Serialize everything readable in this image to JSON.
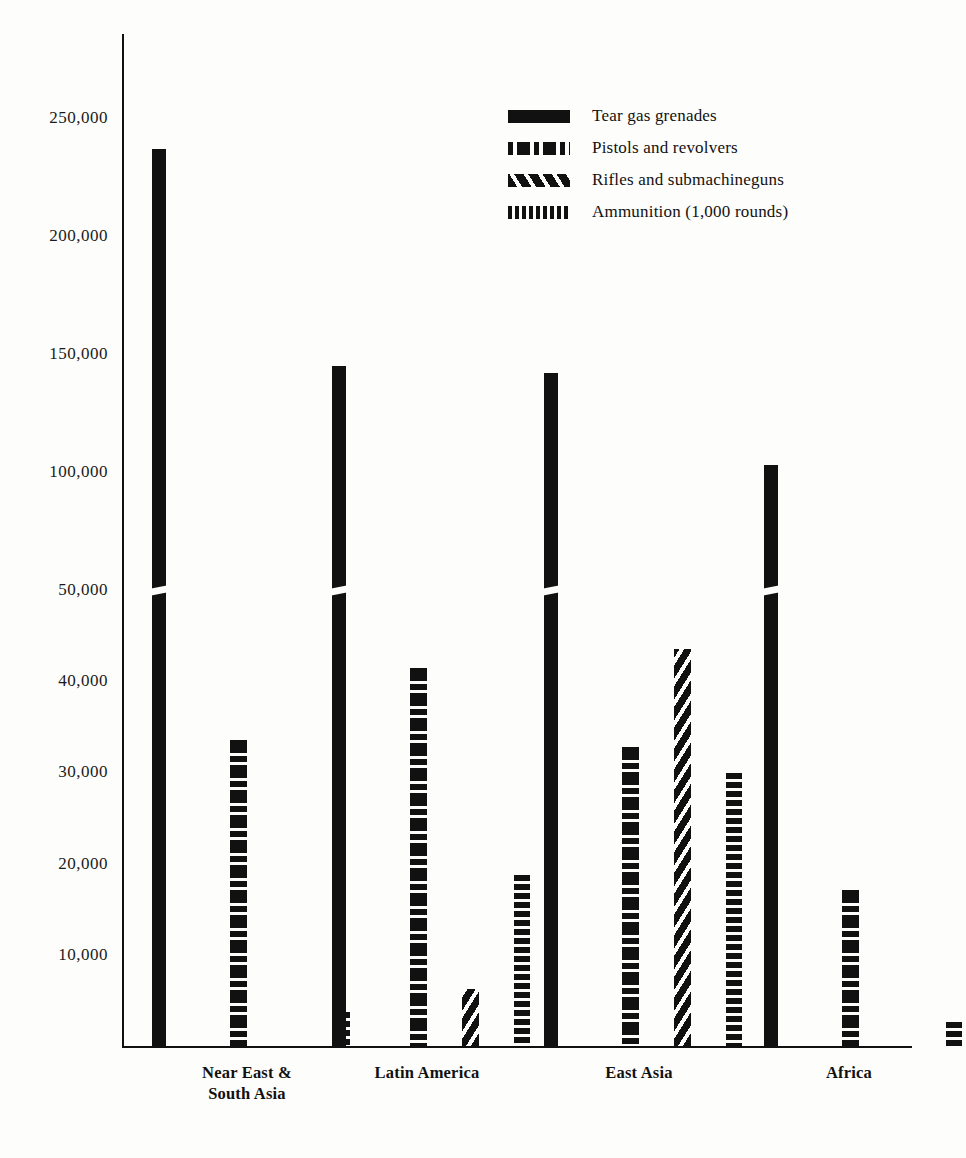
{
  "chart_data": {
    "type": "bar",
    "title": "",
    "subtitle": "",
    "xlabel": "",
    "ylabel": "",
    "grid": false,
    "legend_position": "top-right",
    "axis_note": "y-axis has a scale break between 50,000 and 100,000",
    "ylim": [
      0,
      265000
    ],
    "ytick_labels": [
      "250,000",
      "200,000",
      "150,000",
      "100,000",
      "50,000",
      "40,000",
      "30,000",
      "20,000",
      "10,000"
    ],
    "ytick_values": [
      250000,
      200000,
      150000,
      100000,
      50000,
      40000,
      30000,
      20000,
      10000
    ],
    "categories": [
      "Near East &\nSouth Asia",
      "Latin America",
      "East Asia",
      "Africa"
    ],
    "series": [
      {
        "name": "Tear gas grenades",
        "pattern": "solid",
        "values": [
          237000,
          145000,
          142000,
          103000
        ]
      },
      {
        "name": "Pistols and revolvers",
        "pattern": "dash-dot",
        "values": [
          33500,
          41500,
          32800,
          17100
        ]
      },
      {
        "name": "Rifles and submachineguns",
        "pattern": "diagonal-hatch",
        "values": [
          0,
          6300,
          43500,
          0
        ]
      },
      {
        "name": "Ammunition (1,000 rounds)",
        "pattern": "vertical-stripe",
        "values": [
          3700,
          18800,
          29900,
          2600
        ]
      }
    ]
  },
  "legend": {
    "entries": [
      {
        "label": "Tear gas grenades",
        "swatch": "solid-swatch"
      },
      {
        "label": "Pistols and revolvers",
        "swatch": "dash-dot-swatch"
      },
      {
        "label": "Rifles and submachineguns",
        "swatch": "diagonal-hatch-swatch"
      },
      {
        "label": "Ammunition (1,000 rounds)",
        "swatch": "vertical-stripe-swatch"
      }
    ]
  },
  "colors": {
    "ink": "#111111",
    "paper": "#fdfdfb"
  }
}
